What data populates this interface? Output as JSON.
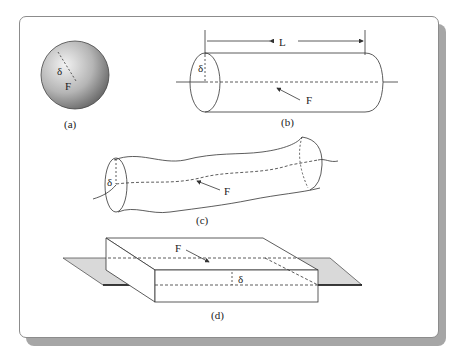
{
  "figure": {
    "panels": [
      {
        "id": "a",
        "caption": "(a)",
        "shape": "sphere",
        "labels": {
          "thickness": "δ",
          "surface": "F"
        }
      },
      {
        "id": "b",
        "caption": "(b)",
        "shape": "straight cylinder",
        "labels": {
          "length": "L",
          "thickness": "δ",
          "surface": "F"
        }
      },
      {
        "id": "c",
        "caption": "(c)",
        "shape": "curved cylinder",
        "labels": {
          "thickness": "δ",
          "surface": "F"
        }
      },
      {
        "id": "d",
        "caption": "(d)",
        "shape": "slab",
        "labels": {
          "thickness": "δ",
          "surface": "F"
        }
      }
    ]
  },
  "colors": {
    "line": "#333333",
    "sphere_light": "#e8e8e8",
    "sphere_dark": "#6e6e6e",
    "plate": "#d9d9d9",
    "frame_border": "#8c8c8c",
    "frame_shadow": "#a6a6a6"
  }
}
